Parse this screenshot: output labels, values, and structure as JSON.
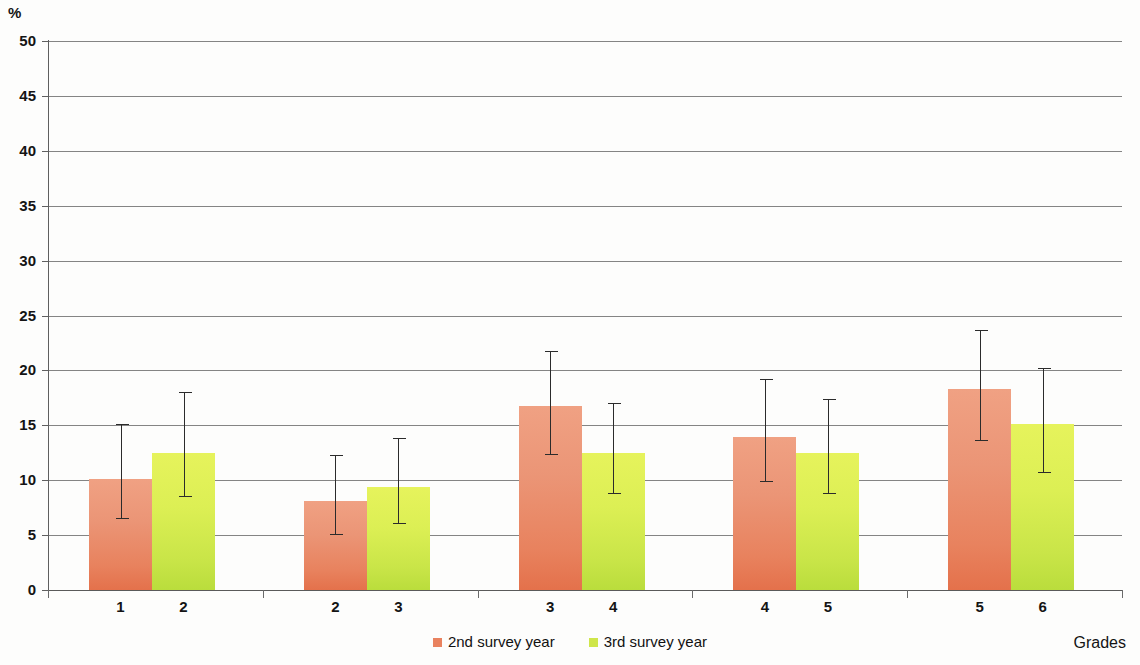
{
  "chart_data": {
    "type": "bar",
    "title": "",
    "subtitle": "",
    "xlabel": "Grades",
    "ylabel": "%",
    "ylim": [
      0,
      50
    ],
    "ytick_step": 5,
    "yticks": [
      0,
      5,
      10,
      15,
      20,
      25,
      30,
      35,
      40,
      45,
      50
    ],
    "grid": true,
    "legend_position": "bottom-center",
    "error_bars": true,
    "categories": [
      "1 2",
      "2 3",
      "3 4",
      "4 5",
      "5 6"
    ],
    "group_tick_labels": [
      [
        "1",
        "2"
      ],
      [
        "2",
        "3"
      ],
      [
        "3",
        "4"
      ],
      [
        "4",
        "5"
      ],
      [
        "5",
        "6"
      ]
    ],
    "series": [
      {
        "name": "2nd survey year",
        "color": "#E9825F",
        "values": [
          10.1,
          8.1,
          16.8,
          13.9,
          18.3
        ],
        "err_low": [
          6.5,
          5.0,
          12.3,
          9.8,
          13.6
        ],
        "err_high": [
          15.1,
          12.3,
          21.8,
          19.2,
          23.7
        ]
      },
      {
        "name": "3rd survey year",
        "color": "#CFE64A",
        "values": [
          12.5,
          9.4,
          12.5,
          12.5,
          15.1
        ],
        "err_low": [
          8.5,
          6.0,
          8.7,
          8.7,
          10.7
        ],
        "err_high": [
          18.0,
          13.8,
          17.0,
          17.4,
          20.2
        ]
      }
    ]
  },
  "legend": {
    "items": [
      {
        "label": "2nd survey year",
        "swatch": "#E9825F"
      },
      {
        "label": "3rd survey year",
        "swatch": "#CFE64A"
      }
    ]
  },
  "axes": {
    "y_title": "%",
    "x_title": "Grades"
  }
}
